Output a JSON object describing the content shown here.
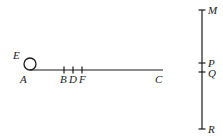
{
  "figure": {
    "background_color": "#ffffff",
    "stroke_color": "#1a1a1a"
  },
  "horizontal_line": {
    "name": "segment-AC",
    "x_start": 30,
    "x_end": 163,
    "y": 70,
    "endpoint_labels": {
      "left": "A",
      "right": "C"
    },
    "tick_points": [
      {
        "label": "B",
        "x": 64
      },
      {
        "label": "D",
        "x": 73
      },
      {
        "label": "F",
        "x": 82
      }
    ]
  },
  "circle": {
    "name": "circle-E",
    "label": "E",
    "center_x": 30,
    "center_y": 64,
    "radius": 6
  },
  "vertical_line": {
    "name": "segment-MR",
    "x": 202,
    "y_start": 10,
    "y_end": 129,
    "endpoint_labels": {
      "top": "M",
      "bottom": "R"
    },
    "tick_points": [
      {
        "label": "P",
        "y": 63
      },
      {
        "label": "Q",
        "y": 72
      }
    ]
  },
  "labels": {
    "A": "A",
    "B": "B",
    "C": "C",
    "D": "D",
    "E": "E",
    "F": "F",
    "M": "M",
    "P": "P",
    "Q": "Q",
    "R": "R"
  }
}
